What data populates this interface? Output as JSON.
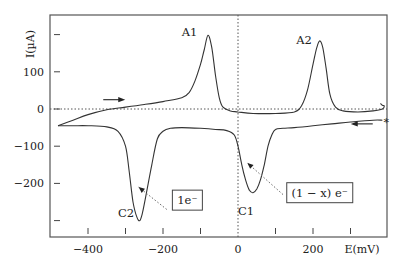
{
  "chart_data": {
    "type": "line",
    "title": "",
    "xlabel": "E(mV)",
    "ylabel": "I(µA)",
    "xlim": [
      -510,
      410
    ],
    "ylim": [
      -350,
      250
    ],
    "grid": false,
    "legend": null,
    "x_ticks": [
      -400,
      -300,
      -200,
      -100,
      0,
      100,
      200,
      300
    ],
    "x_tick_labels": [
      {
        "value": -400,
        "text": "−400"
      },
      {
        "value": -200,
        "text": "−200"
      },
      {
        "value": 0,
        "text": "0"
      },
      {
        "value": 200,
        "text": "200"
      }
    ],
    "y_ticks": [
      200,
      100,
      0,
      -100,
      -200,
      -300
    ],
    "y_tick_labels": [
      {
        "value": 100,
        "text": "100"
      },
      {
        "value": 0,
        "text": "0"
      },
      {
        "value": -100,
        "text": "−100"
      },
      {
        "value": -200,
        "text": "−200"
      }
    ],
    "reference_lines": {
      "x_zero_dotted": true,
      "y_zero_dotted": true
    },
    "series": [
      {
        "name": "Cyclic voltammogram (anodic/forward scan)",
        "x": [
          -480,
          -440,
          -400,
          -350,
          -300,
          -250,
          -200,
          -150,
          -130,
          -115,
          -100,
          -90,
          -80,
          -70,
          -60,
          -50,
          -40,
          -20,
          0,
          40,
          100,
          150,
          170,
          185,
          200,
          210,
          218,
          226,
          235,
          245,
          260,
          280,
          320,
          360,
          385,
          390,
          385,
          380
        ],
        "y": [
          -45,
          -30,
          -15,
          -2,
          5,
          12,
          20,
          30,
          45,
          75,
          120,
          160,
          198,
          165,
          90,
          30,
          5,
          -5,
          -8,
          -12,
          -12,
          -8,
          10,
          50,
          120,
          165,
          183,
          165,
          110,
          40,
          5,
          -5,
          -8,
          -5,
          0,
          8,
          10,
          15
        ]
      },
      {
        "name": "Cyclic voltammogram (cathodic/reverse scan)",
        "x": [
          385,
          360,
          300,
          250,
          200,
          150,
          120,
          100,
          90,
          80,
          70,
          60,
          50,
          40,
          30,
          20,
          10,
          0,
          -10,
          -30,
          -60,
          -100,
          -150,
          -180,
          -200,
          -215,
          -230,
          -245,
          -255,
          -262,
          -270,
          -280,
          -290,
          -300,
          -320,
          -350,
          -400,
          -440,
          -480
        ],
        "y": [
          -30,
          -30,
          -35,
          -40,
          -45,
          -50,
          -52,
          -55,
          -70,
          -100,
          -150,
          -190,
          -215,
          -225,
          -218,
          -190,
          -150,
          -100,
          -70,
          -58,
          -55,
          -52,
          -50,
          -52,
          -60,
          -80,
          -150,
          -230,
          -280,
          -300,
          -290,
          -250,
          -170,
          -100,
          -60,
          -48,
          -45,
          -45,
          -45
        ]
      }
    ],
    "annotations": [
      {
        "text": "A1",
        "x": -150,
        "y": 195,
        "kind": "peak-label"
      },
      {
        "text": "A2",
        "x": 155,
        "y": 175,
        "kind": "peak-label"
      },
      {
        "text": "C2",
        "x": -320,
        "y": -290,
        "kind": "peak-label"
      },
      {
        "text": "C1",
        "x": 0,
        "y": -285,
        "kind": "peak-label"
      },
      {
        "text": "1e⁻",
        "box": true,
        "x": -175,
        "y": -245,
        "pointer_to": [
          -265,
          -210
        ],
        "pointer_from": [
          -190,
          -270
        ]
      },
      {
        "text": "(1 − x) e⁻",
        "box": true,
        "x": 130,
        "y": -225,
        "pointer_to": [
          25,
          -145
        ],
        "pointer_from": [
          120,
          -230
        ]
      },
      {
        "text": "→",
        "kind": "scan-direction-arrow",
        "x": -330,
        "y": 25,
        "direction": "right"
      },
      {
        "text": "←",
        "kind": "scan-direction-arrow",
        "x": 330,
        "y": -40,
        "direction": "left"
      },
      {
        "text": "*",
        "kind": "start-marker",
        "x": 393,
        "y": -35
      }
    ]
  }
}
